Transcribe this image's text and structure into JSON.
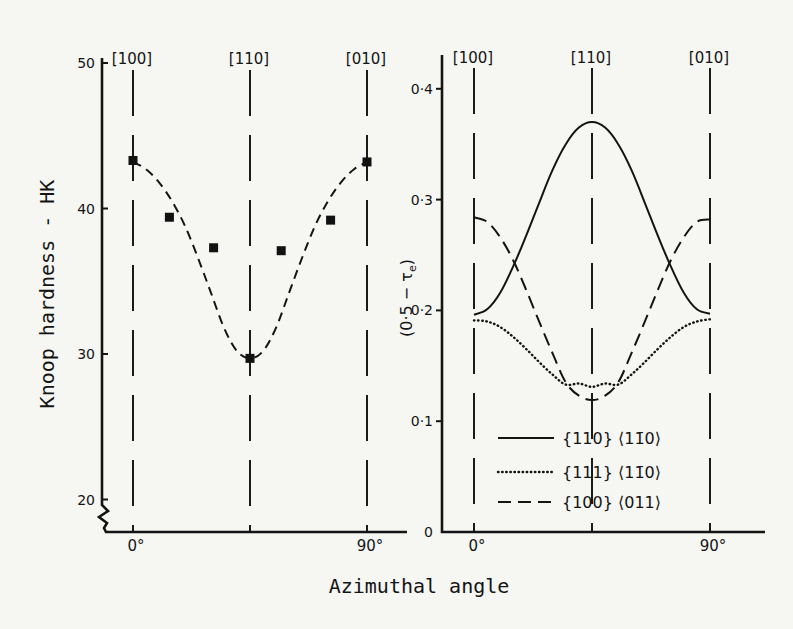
{
  "figure": {
    "xlabel": "Azimuthal angle"
  },
  "chart_data": [
    {
      "panel": "left",
      "type": "scatter",
      "title": "",
      "xlabel": "Azimuthal angle",
      "ylabel": "Knoop hardness - HK",
      "xlim": [
        0,
        90
      ],
      "ylim": [
        20,
        50
      ],
      "yaxis_break": true,
      "grid": false,
      "yticks": [
        20,
        30,
        40,
        50
      ],
      "ytick_labels": [
        "20",
        "30",
        "40",
        "50"
      ],
      "xticks": [
        0,
        90
      ],
      "xtick_labels": [
        "0°",
        "90°"
      ],
      "direction_markers": [
        {
          "angle": 0,
          "label": "[100]"
        },
        {
          "angle": 45,
          "label": "[110]"
        },
        {
          "angle": 90,
          "label": "[010]"
        }
      ],
      "series": [
        {
          "name": "measured hardness",
          "style": "square-markers",
          "x": [
            0,
            14,
            31,
            45,
            57,
            76,
            90
          ],
          "y": [
            43.3,
            39.4,
            37.3,
            29.7,
            37.1,
            39.2,
            43.2
          ]
        },
        {
          "name": "fitted curve",
          "style": "dashed",
          "x": [
            0,
            5,
            10,
            15,
            20,
            25,
            30,
            35,
            40,
            45,
            50,
            55,
            60,
            65,
            70,
            75,
            80,
            85,
            90
          ],
          "y": [
            43.2,
            42.7,
            41.8,
            40.5,
            38.8,
            36.6,
            34.2,
            31.8,
            30.2,
            29.7,
            30.2,
            31.8,
            34.2,
            36.6,
            38.8,
            40.5,
            41.8,
            42.7,
            43.2
          ]
        }
      ],
      "legend": null
    },
    {
      "panel": "right",
      "type": "line",
      "title": "",
      "xlabel": "Azimuthal angle",
      "ylabel": "(0·5 − τe)",
      "ylabel_parts": [
        "(0·5 − τ",
        "e",
        ")"
      ],
      "xlim": [
        0,
        90
      ],
      "ylim": [
        0,
        0.42
      ],
      "grid": false,
      "yticks": [
        0,
        0.1,
        0.2,
        0.3,
        0.4
      ],
      "ytick_labels": [
        "0",
        "0·1",
        "0·2",
        "0·3",
        "0·4"
      ],
      "xticks": [
        0,
        90
      ],
      "xtick_labels": [
        "0°",
        "90°"
      ],
      "direction_markers": [
        {
          "angle": 0,
          "label": "[100]"
        },
        {
          "angle": 45,
          "label": "[110]"
        },
        {
          "angle": 90,
          "label": "[010]"
        }
      ],
      "series": [
        {
          "name": "{110} ⟨11̄0⟩",
          "style": "solid",
          "x": [
            0,
            5,
            10,
            15,
            20,
            25,
            30,
            35,
            40,
            45,
            50,
            55,
            60,
            65,
            70,
            75,
            80,
            85,
            90
          ],
          "y": [
            0.196,
            0.201,
            0.216,
            0.24,
            0.268,
            0.298,
            0.327,
            0.35,
            0.365,
            0.37,
            0.365,
            0.35,
            0.327,
            0.298,
            0.268,
            0.24,
            0.216,
            0.201,
            0.197
          ]
        },
        {
          "name": "{111} ⟨11̄0⟩",
          "style": "dotted",
          "x": [
            0,
            5,
            10,
            15,
            20,
            25,
            30,
            35,
            40,
            45,
            50,
            55,
            60,
            65,
            70,
            75,
            80,
            85,
            90
          ],
          "y": [
            0.191,
            0.19,
            0.185,
            0.176,
            0.165,
            0.153,
            0.142,
            0.133,
            0.134,
            0.131,
            0.134,
            0.133,
            0.142,
            0.153,
            0.165,
            0.176,
            0.185,
            0.19,
            0.192
          ]
        },
        {
          "name": "{100} ⟨011⟩",
          "style": "dashed",
          "x": [
            0,
            5,
            10,
            15,
            20,
            25,
            30,
            35,
            40,
            45,
            50,
            55,
            60,
            65,
            70,
            75,
            80,
            85,
            90
          ],
          "y": [
            0.284,
            0.28,
            0.266,
            0.245,
            0.218,
            0.189,
            0.161,
            0.135,
            0.123,
            0.119,
            0.123,
            0.135,
            0.161,
            0.189,
            0.218,
            0.245,
            0.266,
            0.28,
            0.282
          ]
        }
      ],
      "legend": {
        "position": "lower center, inside plot"
      }
    }
  ]
}
